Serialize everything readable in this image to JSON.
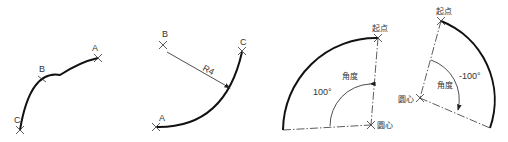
{
  "figures": [
    {
      "id": "three-point-arc",
      "points": {
        "a": "A",
        "b": "B",
        "c": "C"
      }
    },
    {
      "id": "start-end-radius-arc",
      "points": {
        "a": "A",
        "b": "B",
        "c": "C"
      },
      "radius_label": "R4"
    },
    {
      "id": "positive-angle-arc",
      "start_label": "起点",
      "center_label": "圆心",
      "angle_label": "角度",
      "angle_value": "100°"
    },
    {
      "id": "negative-angle-arc",
      "start_label": "起点",
      "center_label": "圆心",
      "angle_label": "角度",
      "angle_value": "-100°"
    }
  ]
}
